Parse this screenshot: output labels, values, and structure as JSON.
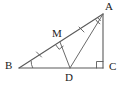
{
  "figure": {
    "type": "geometry-diagram",
    "width": 127,
    "height": 87,
    "background_color": "#ffffff",
    "stroke_color": "#5a5a5a",
    "label_color": "#1a1a1a",
    "points": [
      {
        "id": "A",
        "label": "A",
        "x": 103,
        "y": 14,
        "label_x": 105,
        "label_y": 1
      },
      {
        "id": "B",
        "label": "B",
        "x": 19,
        "y": 68,
        "label_x": 5,
        "label_y": 61
      },
      {
        "id": "C",
        "label": "C",
        "x": 103,
        "y": 68,
        "label_x": 108,
        "label_y": 62
      },
      {
        "id": "D",
        "label": "D",
        "x": 70,
        "y": 68,
        "label_x": 66,
        "label_y": 73
      },
      {
        "id": "M",
        "label": "M",
        "x": 60,
        "y": 42,
        "label_x": 53,
        "label_y": 28
      }
    ],
    "segments": [
      {
        "id": "BC",
        "from": "B",
        "to": "C",
        "name": "segment-bc"
      },
      {
        "id": "AC",
        "from": "A",
        "to": "C",
        "name": "segment-ac"
      },
      {
        "id": "BA",
        "from": "B",
        "to": "A",
        "name": "segment-ba"
      },
      {
        "id": "AD",
        "from": "A",
        "to": "D",
        "name": "segment-ad"
      },
      {
        "id": "MD",
        "from": "M",
        "to": "D",
        "name": "segment-md"
      }
    ],
    "marks": [
      {
        "id": "right-angle-C",
        "type": "right-angle",
        "at": "C",
        "note": "square mark at vertex C"
      },
      {
        "id": "right-angle-M",
        "type": "right-angle",
        "at": "M",
        "note": "square mark at M between MB and MD"
      },
      {
        "id": "angle-arcs-A",
        "type": "double-arc",
        "at": "A",
        "note": "two arcs indicating AD bisects angle A"
      },
      {
        "id": "angle-arc-B",
        "type": "single-arc",
        "at": "B",
        "note": "arc at vertex B"
      },
      {
        "id": "tick-BM",
        "type": "tick",
        "on": "BM",
        "count": 1,
        "note": "congruence tick on BM"
      },
      {
        "id": "tick-MA",
        "type": "tick",
        "on": "MA",
        "count": 1,
        "note": "congruence tick on MA"
      }
    ]
  }
}
